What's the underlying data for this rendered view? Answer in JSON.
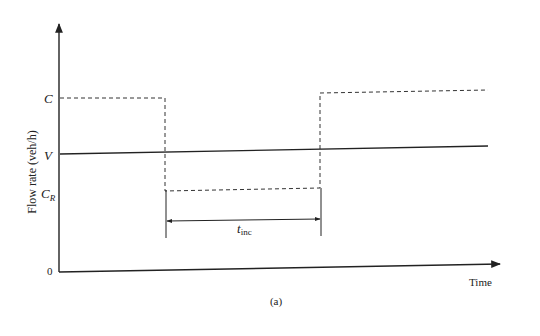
{
  "figure": {
    "caption": "(a)",
    "y_axis_label": "Flow rate (veh/h)",
    "x_axis_label": "Time",
    "origin_label": "0",
    "y_levels": {
      "C": {
        "label": "C"
      },
      "V": {
        "label": "V"
      },
      "C_R": {
        "label": "C",
        "subscript": "R"
      }
    },
    "interval": {
      "label": "t",
      "subscript": "inc"
    }
  },
  "colors": {
    "line": "#222222",
    "dashed": "#333333",
    "background": "#ffffff"
  }
}
